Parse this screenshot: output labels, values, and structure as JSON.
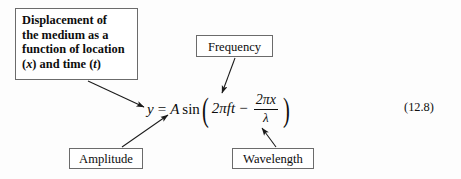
{
  "figure": {
    "background_color": "#fdfdfd",
    "ink_color": "#0d0d0d",
    "box_border_color": "#6b6b6b",
    "equation_number": "(12.8)"
  },
  "callouts": {
    "displacement": {
      "line1": "Displacement of",
      "line2": "the medium as a",
      "line3": "function of location",
      "line4_pre": "(",
      "line4_var1": "x",
      "line4_mid": ") and time (",
      "line4_var2": "t",
      "line4_post": ")"
    },
    "frequency": {
      "label": "Frequency"
    },
    "amplitude": {
      "label": "Amplitude"
    },
    "wavelength": {
      "label": "Wavelength"
    }
  },
  "equation": {
    "lhs": "y",
    "equals": "=",
    "amplitude_symbol": "A",
    "function": "sin",
    "open_paren": "(",
    "term1": "2πft",
    "minus": "−",
    "numerator": "2πx",
    "denominator": "λ",
    "close_paren": ")"
  },
  "annotations": {
    "arrow_displacement_to_y": "arrow from displacement box to y",
    "arrow_frequency_to_f": "arrow from frequency box to f",
    "arrow_amplitude_to_A": "arrow from amplitude box to A",
    "arrow_wavelength_to_lambda": "arrow from wavelength box to lambda"
  }
}
